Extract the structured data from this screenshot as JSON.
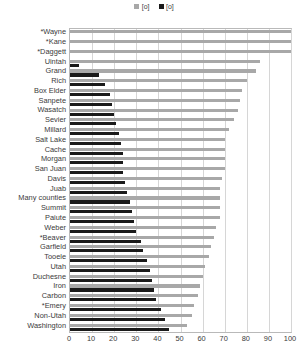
{
  "chart_data": {
    "type": "bar",
    "orientation": "horizontal",
    "title": "",
    "subtitle": "",
    "xlabel": "",
    "ylabel": "",
    "xlim": [
      0,
      100
    ],
    "ylim": null,
    "grid": true,
    "grid_axis": "x",
    "legend_position": "top-center",
    "xticks": [
      0,
      10,
      20,
      30,
      40,
      50,
      60,
      70,
      80,
      90,
      100
    ],
    "xticklabels": [
      "0",
      "10",
      "20",
      "30",
      "40",
      "50",
      "60",
      "70",
      "80",
      "90",
      "100"
    ],
    "categories": [
      "*Wayne",
      "*Kane",
      "*Daggett",
      "Uintah",
      "Grand",
      "Rich",
      "Box Elder",
      "Sanpete",
      "Wasatch",
      "Sevier",
      "Millard",
      "Salt Lake",
      "Cache",
      "Morgan",
      "San Juan",
      "Davis",
      "Juab",
      "Many counties",
      "Summit",
      "Paiute",
      "Weber",
      "*Beaver",
      "Garfield",
      "Tooele",
      "Utah",
      "Duchesne",
      "Iron",
      "Carbon",
      "*Emery",
      "Non-Utah",
      "Washington"
    ],
    "series": [
      {
        "name": "[o]",
        "color": "#a8a8a8",
        "values": [
          100,
          100,
          100,
          86,
          84,
          80,
          78,
          77,
          76,
          74,
          72,
          70,
          70,
          70,
          70,
          69,
          68,
          68,
          68,
          68,
          66,
          65,
          64,
          63,
          61,
          60,
          59,
          58,
          56,
          55,
          53
        ]
      },
      {
        "name": "[o]",
        "color": "#1a1a1a",
        "values": [
          0,
          0,
          0,
          4,
          13,
          16,
          18,
          19,
          20,
          21,
          22,
          23,
          24,
          24,
          24,
          25,
          26,
          27,
          28,
          29,
          30,
          32,
          33,
          35,
          36,
          37,
          38,
          39,
          41,
          43,
          45
        ]
      }
    ],
    "legend": [
      {
        "label": "[o]",
        "color": "#a8a8a8",
        "marker": "square"
      },
      {
        "label": "[o]",
        "color": "#1a1a1a",
        "marker": "square"
      }
    ]
  }
}
